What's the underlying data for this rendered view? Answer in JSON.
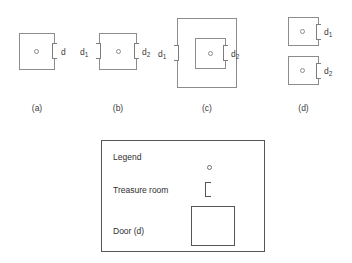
{
  "figure": {
    "panels": [
      {
        "caption": "(a)",
        "doors": [
          {
            "label": "d",
            "sub": ""
          }
        ],
        "treasure_rooms": 1,
        "rooms": 1
      },
      {
        "caption": "(b)",
        "doors": [
          {
            "label": "d",
            "sub": "1"
          },
          {
            "label": "d",
            "sub": "2"
          }
        ],
        "treasure_rooms": 1,
        "rooms": 1
      },
      {
        "caption": "(c)",
        "doors": [
          {
            "label": "d",
            "sub": "1"
          },
          {
            "label": "d",
            "sub": "2"
          }
        ],
        "treasure_rooms": 1,
        "rooms": 2
      },
      {
        "caption": "(d)",
        "doors": [
          {
            "label": "d",
            "sub": "1"
          },
          {
            "label": "d",
            "sub": "2"
          }
        ],
        "treasure_rooms": 2,
        "rooms": 2
      }
    ]
  },
  "legend": {
    "title": "Legend",
    "rows": [
      {
        "label": "Legend",
        "symbol": "treasure-circle-icon"
      },
      {
        "label": "Treasure room",
        "symbol": "door-bracket-icon"
      },
      {
        "label": "Door (d)",
        "symbol": "room-square-icon"
      }
    ]
  },
  "colors": {
    "stroke": "#8c8c8c",
    "legend_stroke": "#555555",
    "text": "#3a3a3a",
    "background": "#ffffff"
  }
}
